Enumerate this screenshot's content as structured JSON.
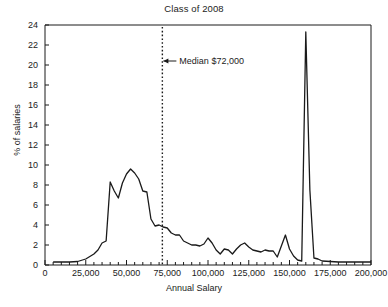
{
  "chart_data": {
    "type": "line",
    "title": "Class of 2008",
    "xlabel": "Annual Salary",
    "ylabel": "% of salaries",
    "xlim": [
      0,
      200000
    ],
    "ylim": [
      0,
      24
    ],
    "xticks": [
      0,
      25000,
      50000,
      75000,
      100000,
      125000,
      150000,
      175000,
      200000
    ],
    "xticklabels": [
      "0",
      "25,000",
      "50,000",
      "75,000",
      "100,000",
      "125,000",
      "150,000",
      "175,000",
      "200,000"
    ],
    "xminor_step": 5000,
    "yticks": [
      0,
      2,
      4,
      6,
      8,
      10,
      12,
      14,
      16,
      18,
      20,
      22,
      24
    ],
    "yticklabels": [
      "0",
      "2",
      "4",
      "6",
      "8",
      "10",
      "12",
      "14",
      "16",
      "18",
      "20",
      "22",
      "24"
    ],
    "grid": false,
    "legend": false,
    "line_color": "#1a1a1a",
    "series": [
      {
        "name": "% of salaries",
        "x": [
          5000,
          10000,
          15000,
          20000,
          25000,
          30000,
          32500,
          35000,
          37500,
          40000,
          42500,
          45000,
          47500,
          50000,
          52500,
          55000,
          57500,
          60000,
          62500,
          65000,
          67500,
          70000,
          72500,
          75000,
          77500,
          80000,
          82500,
          85000,
          87500,
          90000,
          92500,
          95000,
          97500,
          100000,
          102500,
          105000,
          107500,
          110000,
          112500,
          115000,
          117500,
          120000,
          122500,
          125000,
          127500,
          130000,
          132500,
          135000,
          137500,
          140000,
          142500,
          145000,
          147500,
          150000,
          152500,
          155000,
          157500,
          160000,
          162500,
          165000,
          167500,
          170000,
          175000,
          180000,
          185000,
          190000,
          195000,
          200000
        ],
        "values": [
          0.3,
          0.3,
          0.3,
          0.35,
          0.6,
          1.1,
          1.5,
          2.2,
          2.4,
          8.3,
          7.4,
          6.7,
          8.2,
          9.1,
          9.6,
          9.2,
          8.6,
          7.4,
          7.3,
          4.6,
          3.9,
          4.0,
          3.8,
          3.7,
          3.2,
          3.0,
          3.0,
          2.4,
          2.2,
          2.0,
          2.0,
          1.9,
          2.1,
          2.7,
          2.2,
          1.5,
          1.1,
          1.6,
          1.5,
          1.1,
          1.6,
          2.0,
          2.2,
          1.8,
          1.5,
          1.4,
          1.3,
          1.5,
          1.4,
          1.4,
          0.8,
          1.9,
          3.0,
          1.6,
          0.9,
          0.5,
          0.4,
          23.3,
          7.5,
          0.7,
          0.6,
          0.4,
          0.35,
          0.3,
          0.3,
          0.3,
          0.3,
          0.3
        ]
      }
    ],
    "annotations": [
      {
        "name": "median-marker",
        "label": "Median $72,000",
        "x_value": 72000,
        "y_label_value": 20.4,
        "style": "dotted-vertical-line-with-left-arrow"
      }
    ]
  }
}
